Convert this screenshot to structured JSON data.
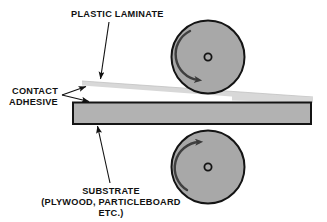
{
  "diagram": {
    "labels": {
      "plastic_laminate": "PLASTIC LAMINATE",
      "contact_line1": "CONTACT",
      "contact_line2": "ADHESIVE",
      "substrate_line1": "SUBSTRATE",
      "substrate_line2": "(PLYWOOD, PARTICLEBOARD",
      "substrate_line3": "ETC.)"
    },
    "parts": {
      "top_roller": {
        "name": "top-roller",
        "cx": 208,
        "cy": 57,
        "r": 37,
        "rotation": "clockwise"
      },
      "bottom_roller": {
        "name": "bottom-roller",
        "cx": 208,
        "cy": 167,
        "r": 37,
        "rotation": "counter-clockwise"
      },
      "substrate_bar": {
        "name": "substrate-bar",
        "x": 73,
        "y": 103,
        "width": 238,
        "height": 21
      },
      "laminate_sheet": {
        "name": "laminate-sheet",
        "tip_x": 82,
        "tip_y": 81,
        "end_x": 313,
        "end_y": 100
      }
    },
    "colors": {
      "roller_fill": "#a8a8a8",
      "roller_stroke": "#1a1a1a",
      "substrate_fill": "#b0b0b0",
      "substrate_stroke": "#141414",
      "laminate_fill": "#d4d4d4",
      "arrow": "#3a3a3a",
      "leader": "#1a1a1a",
      "text": "#111111",
      "background": "#ffffff"
    },
    "icons": {
      "top_rotation": "clockwise-rotation-arrow-icon",
      "bottom_rotation": "counterclockwise-rotation-arrow-icon",
      "hub": "roller-hub-icon"
    }
  }
}
